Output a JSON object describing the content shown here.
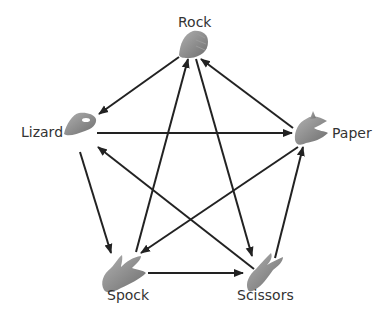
{
  "nodes": [
    {
      "id": "rock",
      "label": "Rock"
    },
    {
      "id": "paper",
      "label": "Paper"
    },
    {
      "id": "scissors",
      "label": "Scissors"
    },
    {
      "id": "spock",
      "label": "Spock"
    },
    {
      "id": "lizard",
      "label": "Lizard"
    }
  ],
  "edges": [
    {
      "from": "rock",
      "to": "lizard"
    },
    {
      "from": "paper",
      "to": "rock"
    },
    {
      "from": "lizard",
      "to": "paper"
    },
    {
      "from": "scissors",
      "to": "lizard"
    },
    {
      "from": "paper",
      "to": "spock"
    },
    {
      "from": "spock",
      "to": "rock"
    },
    {
      "from": "rock",
      "to": "scissors"
    },
    {
      "from": "lizard",
      "to": "spock"
    },
    {
      "from": "spock",
      "to": "scissors"
    },
    {
      "from": "scissors",
      "to": "paper"
    }
  ],
  "colors": {
    "arrow": "#222222",
    "hand": "#8a8a8a",
    "label": "#333333"
  }
}
